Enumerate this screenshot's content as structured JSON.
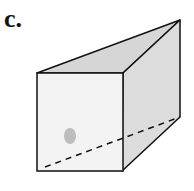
{
  "figure": {
    "label": "c.",
    "shape": "square-based pyramid-like prism (box tapering to apex)",
    "colors": {
      "front_face": "#f3f3f3",
      "top_face": "#d6d6d6",
      "side_face": "#dcdcdc",
      "edges": "#111111",
      "smudge": "#9a9a9a"
    }
  }
}
